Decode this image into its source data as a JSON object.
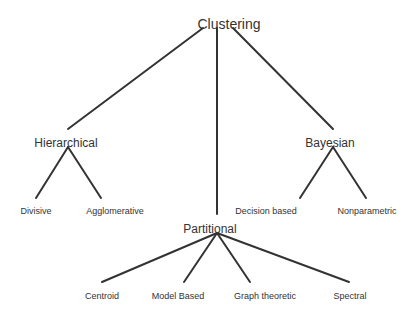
{
  "diagram": {
    "type": "tree",
    "line_color": "#333333",
    "root": {
      "label": "Clustering",
      "x": 229,
      "y": 17
    },
    "level1": [
      {
        "label": "Hierarchical",
        "x": 66,
        "y": 137
      },
      {
        "label": "Partitional",
        "x": 217,
        "y": 223
      },
      {
        "label": "Bayesian",
        "x": 330,
        "y": 137
      }
    ],
    "leaves": [
      {
        "label": "Divisive",
        "x": 38,
        "y": 207,
        "parent": "Hierarchical"
      },
      {
        "label": "Agglomerative",
        "x": 114,
        "y": 207,
        "parent": "Hierarchical"
      },
      {
        "label": "Decision based",
        "x": 266,
        "y": 207,
        "parent": "Bayesian"
      },
      {
        "label": "Nonparametric",
        "x": 366,
        "y": 207,
        "parent": "Bayesian"
      },
      {
        "label": "Centroid",
        "x": 102,
        "y": 291,
        "parent": "Partitional"
      },
      {
        "label": "Model Based",
        "x": 178,
        "y": 291,
        "parent": "Partitional"
      },
      {
        "label": "Graph theoretic",
        "x": 262,
        "y": 291,
        "parent": "Partitional"
      },
      {
        "label": "Spectral",
        "x": 352,
        "y": 291,
        "parent": "Partitional"
      }
    ]
  }
}
